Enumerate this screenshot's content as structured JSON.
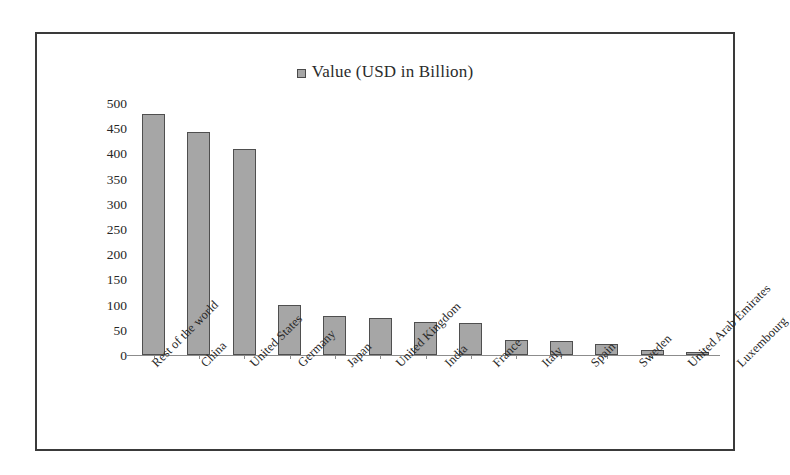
{
  "chart_data": {
    "type": "bar",
    "title": "",
    "subtitle": "",
    "xlabel": "",
    "ylabel": "",
    "legend": [
      {
        "label": "Value (USD in Billion)",
        "color": "#a6a6a6"
      }
    ],
    "legend_position": "top-center",
    "grid": false,
    "ylim": [
      0,
      500
    ],
    "ytick_labels": [
      "500",
      "450",
      "400",
      "350",
      "300",
      "250",
      "200",
      "150",
      "100",
      "50",
      "0"
    ],
    "yticks": [
      500,
      450,
      400,
      350,
      300,
      250,
      200,
      150,
      100,
      50,
      0
    ],
    "categories": [
      "Rest of the world",
      "China",
      "United States",
      "Germany",
      "Japan",
      "United Kingdom",
      "India",
      "France",
      "Italy",
      "Spain",
      "Sweden",
      "United Arab Emirates",
      "Luxembourg"
    ],
    "series": [
      {
        "name": "Value (USD in Billion)",
        "color": "#a6a6a6",
        "values": [
          480,
          445,
          410,
          100,
          78,
          74,
          66,
          63,
          30,
          28,
          22,
          10,
          5
        ]
      }
    ]
  },
  "figure": {
    "border_color": "#3a3a3a",
    "background": "#ffffff",
    "bar_fill": "#a6a6a6",
    "bar_stroke": "#4f4f4f",
    "axis_color": "#8c8c8c",
    "text_color": "#262626"
  }
}
